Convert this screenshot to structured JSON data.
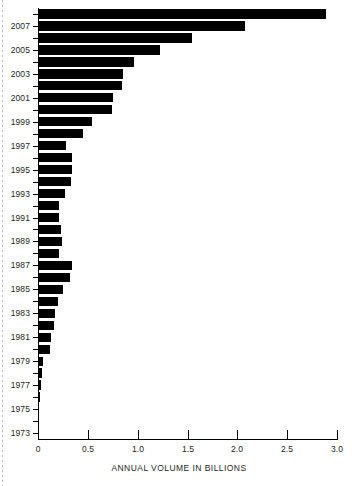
{
  "chart_data": {
    "type": "bar",
    "orientation": "horizontal",
    "title": "",
    "xlabel": "ANNUAL VOLUME IN BILLIONS",
    "ylabel": "",
    "xlim": [
      0,
      3.0
    ],
    "xticks": [
      "0",
      "0.5",
      "1.0",
      "1.5",
      "2.0",
      "2.5",
      "3.0"
    ],
    "xtick_values": [
      0,
      0.5,
      1.0,
      1.5,
      2.0,
      2.5,
      3.0
    ],
    "grid": false,
    "legend": null,
    "categories": [
      "2008",
      "2007",
      "2006",
      "2005",
      "2004",
      "2003",
      "2002",
      "2001",
      "2000",
      "1999",
      "1998",
      "1997",
      "1996",
      "1995",
      "1994",
      "1993",
      "1992",
      "1991",
      "1990",
      "1989",
      "1988",
      "1987",
      "1986",
      "1985",
      "1984",
      "1983",
      "1982",
      "1981",
      "1980",
      "1979",
      "1978",
      "1977",
      "1976",
      "1975",
      "1974",
      "1973"
    ],
    "values": [
      2.89,
      2.08,
      1.55,
      1.22,
      0.96,
      0.85,
      0.84,
      0.75,
      0.74,
      0.54,
      0.45,
      0.28,
      0.34,
      0.34,
      0.33,
      0.27,
      0.21,
      0.21,
      0.23,
      0.24,
      0.21,
      0.34,
      0.32,
      0.25,
      0.2,
      0.17,
      0.16,
      0.13,
      0.12,
      0.05,
      0.04,
      0.03,
      0.02,
      0.012,
      0.008,
      0.004
    ],
    "ytick_labels": [
      "2007",
      "2005",
      "2003",
      "2001",
      "1999",
      "1997",
      "1995",
      "1993",
      "1991",
      "1989",
      "1987",
      "1985",
      "1983",
      "1981",
      "1979",
      "1977",
      "1975",
      "1973"
    ],
    "bar_color": "#000000",
    "axis_color": "#000000",
    "background": "#ffffff"
  }
}
